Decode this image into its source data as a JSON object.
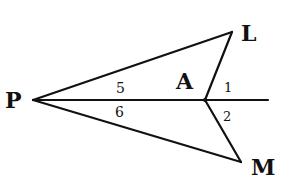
{
  "diagram": {
    "type": "geometry",
    "points": {
      "P": {
        "label": "P",
        "x": 33,
        "y": 100
      },
      "L": {
        "label": "L",
        "x": 232,
        "y": 32
      },
      "A": {
        "label": "A",
        "x": 205,
        "y": 100
      },
      "M": {
        "label": "M",
        "x": 241,
        "y": 162
      }
    },
    "segments": [
      "PL",
      "LA",
      "PA",
      "AM",
      "PM"
    ],
    "ray": {
      "from": "P",
      "through": "A",
      "label": "line PA extended"
    },
    "angles": [
      {
        "id": "5",
        "label": "5",
        "at": "P",
        "between": [
          "PL",
          "PA"
        ]
      },
      {
        "id": "6",
        "label": "6",
        "at": "P",
        "between": [
          "PA",
          "PM"
        ]
      },
      {
        "id": "1",
        "label": "1",
        "at": "A",
        "between": [
          "AL",
          "ray beyond A"
        ]
      },
      {
        "id": "2",
        "label": "2",
        "at": "A",
        "between": [
          "ray beyond A",
          "AM"
        ]
      }
    ],
    "colors": {
      "ink": "#111111",
      "background": "#ffffff"
    }
  }
}
